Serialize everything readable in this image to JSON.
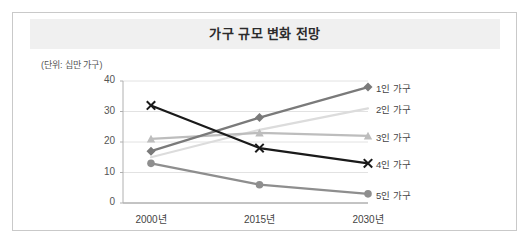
{
  "figure": {
    "title": "가구 규모 변화 전망",
    "unit_note": "(단위: 십만 가구)"
  },
  "chart_data": {
    "type": "line",
    "title": "가구 규모 변화 전망",
    "xlabel": "",
    "ylabel": "(단위: 십만 가구)",
    "categories": [
      "2000년",
      "2015년",
      "2030년"
    ],
    "yticks": [
      0,
      10,
      20,
      30,
      40
    ],
    "ylim": [
      0,
      40
    ],
    "grid": true,
    "legend_position": "right-inline",
    "series": [
      {
        "name": "1인 가구",
        "values": [
          17,
          28,
          38
        ],
        "color": "#7a7a7a",
        "marker": "diamond"
      },
      {
        "name": "2인 가구",
        "values": [
          15,
          24,
          31
        ],
        "color": "#dcdcdc",
        "marker": "none"
      },
      {
        "name": "3인 가구",
        "values": [
          21,
          23,
          22
        ],
        "color": "#bdbdbd",
        "marker": "triangle"
      },
      {
        "name": "4인 가구",
        "values": [
          32,
          18,
          13
        ],
        "color": "#1a1a1a",
        "marker": "x"
      },
      {
        "name": "5인 가구",
        "values": [
          13,
          6,
          3
        ],
        "color": "#8e8e8e",
        "marker": "circle"
      }
    ]
  }
}
